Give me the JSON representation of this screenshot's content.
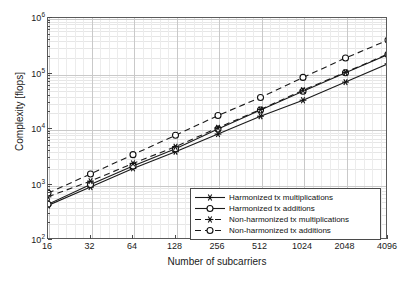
{
  "chart_data": {
    "type": "line",
    "title": "",
    "xlabel": "Number of subcarriers",
    "ylabel": "Complexity [flops]",
    "xscale": "log2",
    "yscale": "log10",
    "x": [
      16,
      32,
      64,
      128,
      256,
      512,
      1024,
      2048,
      4096
    ],
    "xtick_labels": [
      "16",
      "32",
      "64",
      "128",
      "256",
      "512",
      "1024",
      "2048",
      "4096"
    ],
    "ytick_labels": [
      "10",
      "10",
      "10",
      "10",
      "10"
    ],
    "ytick_exponents": [
      "2",
      "3",
      "4",
      "5",
      "6"
    ],
    "ylim": [
      100,
      1000000
    ],
    "xlim": [
      16,
      4096
    ],
    "grid": true,
    "minor_grid": true,
    "legend_position": "lower right",
    "series": [
      {
        "name": "Harmonized tx multiplications",
        "marker": "star",
        "linestyle": "solid",
        "color": "#1a1a1a",
        "values": [
          420,
          900,
          1950,
          3900,
          8100,
          17000,
          33000,
          70000,
          150000
        ]
      },
      {
        "name": "Harmonized tx additions",
        "marker": "circle",
        "linestyle": "solid",
        "color": "#1a1a1a",
        "values": [
          440,
          1000,
          2150,
          4400,
          10000,
          22000,
          48000,
          103000,
          220000
        ]
      },
      {
        "name": "Non-harmonized tx multiplications",
        "marker": "star",
        "linestyle": "dashed",
        "color": "#1a1a1a",
        "values": [
          600,
          1150,
          2400,
          4800,
          10500,
          22500,
          50000,
          105000,
          225000
        ]
      },
      {
        "name": "Non-harmonized tx additions",
        "marker": "circle",
        "linestyle": "dashed",
        "color": "#1a1a1a",
        "values": [
          700,
          1550,
          3450,
          7700,
          17500,
          37000,
          85000,
          190000,
          400000
        ]
      }
    ]
  },
  "axes": {
    "xlabel": "Number of subcarriers",
    "ylabel": "Complexity [flops]"
  },
  "legend": {
    "items": [
      {
        "label": "Harmonized tx multiplications"
      },
      {
        "label": "Harmonized tx additions"
      },
      {
        "label": "Non-harmonized tx multiplications"
      },
      {
        "label": "Non-harmonized tx additions"
      }
    ]
  }
}
